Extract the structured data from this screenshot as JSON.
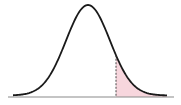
{
  "diagram": {
    "type": "normal-distribution-curve",
    "colors": {
      "curve": "#1a1a1a",
      "baseline": "#8a8a8a",
      "shaded_region": "#f7d6dd",
      "cutoff_line": "#333333",
      "background": "#ffffff"
    },
    "shaded_region": "right-tail",
    "cutoff_position_fraction": 0.67
  }
}
